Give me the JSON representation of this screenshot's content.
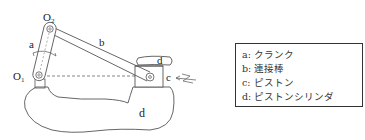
{
  "diagram": {
    "labels": {
      "o2": "O",
      "o2_sub": "2",
      "o1": "O",
      "o1_sub": "1",
      "crank": "a",
      "rod": "b",
      "piston": "c",
      "cylinder_top": "d",
      "cylinder_body": "d"
    },
    "colors": {
      "line": "#444444",
      "background": "#ffffff"
    }
  },
  "legend": {
    "items": [
      {
        "key": "a:",
        "label": "クランク"
      },
      {
        "key": "b:",
        "label": "連接棒"
      },
      {
        "key": "c:",
        "label": "ピストン"
      },
      {
        "key": "d:",
        "label": "ピストンシリンダ"
      }
    ]
  }
}
